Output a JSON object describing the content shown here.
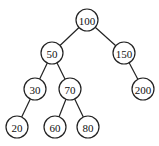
{
  "diagram": {
    "type": "binary-search-tree",
    "nodes": [
      {
        "id": "n100",
        "label": "100",
        "x": 87,
        "y": 20
      },
      {
        "id": "n50",
        "label": "50",
        "x": 52,
        "y": 53
      },
      {
        "id": "n150",
        "label": "150",
        "x": 124,
        "y": 53
      },
      {
        "id": "n30",
        "label": "30",
        "x": 35,
        "y": 89
      },
      {
        "id": "n70",
        "label": "70",
        "x": 70,
        "y": 89
      },
      {
        "id": "n200",
        "label": "200",
        "x": 143,
        "y": 89
      },
      {
        "id": "n20",
        "label": "20",
        "x": 17,
        "y": 127
      },
      {
        "id": "n60",
        "label": "60",
        "x": 55,
        "y": 127
      },
      {
        "id": "n80",
        "label": "80",
        "x": 88,
        "y": 127
      }
    ],
    "edges": [
      [
        "n100",
        "n50"
      ],
      [
        "n100",
        "n150"
      ],
      [
        "n50",
        "n30"
      ],
      [
        "n50",
        "n70"
      ],
      [
        "n150",
        "n200"
      ],
      [
        "n30",
        "n20"
      ],
      [
        "n70",
        "n60"
      ],
      [
        "n70",
        "n80"
      ]
    ]
  }
}
